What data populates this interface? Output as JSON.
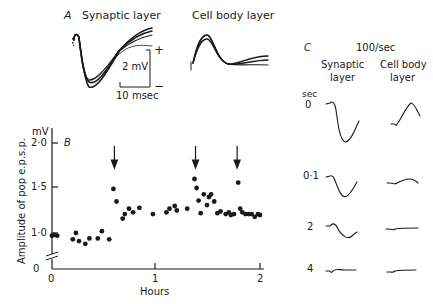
{
  "panel_a": {
    "letter": "A",
    "synaptic_title": "Synaptic layer",
    "cellbody_title": "Cell body layer",
    "scale_voltage": "2 mV",
    "scale_time": "10 msec",
    "polarity_plus": "+",
    "polarity_minus": "−"
  },
  "panel_b": {
    "letter": "B",
    "y_unit": "mV",
    "ylabel": "Amplitude of pop e.p.s.p.",
    "xlabel": "Hours",
    "yticks": [
      "2·0",
      "1·5",
      "1·0",
      "0"
    ],
    "xticks": [
      "0",
      "1",
      "2"
    ]
  },
  "panel_c": {
    "letter": "C",
    "rate": "100/sec",
    "col1_line1": "Synaptic",
    "col1_line2": "layer",
    "col2_line1": "Cell body",
    "col2_line2": "layer",
    "time_unit": "sec",
    "rows": [
      "0",
      "0·1",
      "2",
      "4"
    ]
  },
  "chart_data": {
    "type": "scatter",
    "title": "",
    "xlabel": "Hours",
    "ylabel": "Amplitude of pop e.p.s.p. (mV)",
    "xlim": [
      0,
      2.1
    ],
    "ylim": [
      0,
      2.1
    ],
    "y_axis_break": true,
    "grid": false,
    "tetanus_arrows_hours": [
      0.6,
      1.38,
      1.78
    ],
    "points": [
      [
        0.0,
        0.97
      ],
      [
        0.02,
        0.98
      ],
      [
        0.05,
        0.97
      ],
      [
        0.2,
        0.93
      ],
      [
        0.23,
        1.0
      ],
      [
        0.26,
        0.91
      ],
      [
        0.32,
        0.88
      ],
      [
        0.36,
        0.94
      ],
      [
        0.44,
        0.94
      ],
      [
        0.48,
        1.02
      ],
      [
        0.55,
        0.93
      ],
      [
        0.59,
        1.49
      ],
      [
        0.62,
        1.35
      ],
      [
        0.68,
        1.16
      ],
      [
        0.7,
        1.21
      ],
      [
        0.74,
        1.27
      ],
      [
        0.78,
        1.23
      ],
      [
        0.84,
        1.28
      ],
      [
        0.97,
        1.21
      ],
      [
        1.1,
        1.23
      ],
      [
        1.13,
        1.27
      ],
      [
        1.18,
        1.3
      ],
      [
        1.2,
        1.25
      ],
      [
        1.3,
        1.27
      ],
      [
        1.37,
        1.6
      ],
      [
        1.39,
        1.5
      ],
      [
        1.41,
        1.36
      ],
      [
        1.43,
        1.22
      ],
      [
        1.46,
        1.43
      ],
      [
        1.49,
        1.31
      ],
      [
        1.51,
        1.4
      ],
      [
        1.53,
        1.43
      ],
      [
        1.56,
        1.35
      ],
      [
        1.59,
        1.22
      ],
      [
        1.62,
        1.24
      ],
      [
        1.67,
        1.21
      ],
      [
        1.7,
        1.23
      ],
      [
        1.72,
        1.2
      ],
      [
        1.75,
        1.21
      ],
      [
        1.79,
        1.56
      ],
      [
        1.81,
        1.27
      ],
      [
        1.83,
        1.23
      ],
      [
        1.86,
        1.21
      ],
      [
        1.89,
        1.21
      ],
      [
        1.92,
        1.21
      ],
      [
        1.95,
        1.18
      ],
      [
        1.98,
        1.21
      ],
      [
        2.0,
        1.2
      ]
    ]
  }
}
